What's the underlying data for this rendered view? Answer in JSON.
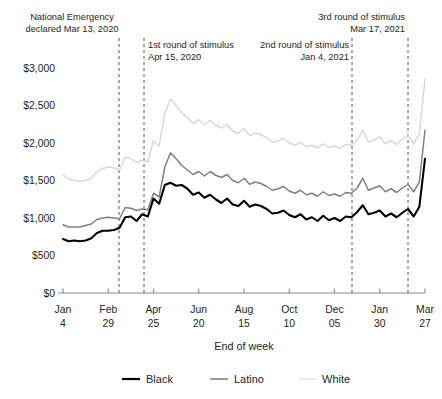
{
  "chart_data": {
    "type": "line",
    "title": "",
    "xlabel": "End of week",
    "ylabel": "",
    "ylim": [
      0,
      3000
    ],
    "ytick_values": [
      0,
      500,
      1000,
      1500,
      2000,
      2500,
      3000
    ],
    "ytick_labels": [
      "$0",
      "$500",
      "$1,000",
      "$1,500",
      "$2,000",
      "$2,500",
      "$3,000"
    ],
    "xtick_labels": [
      {
        "line1": "Jan",
        "line2": "4",
        "index": 0
      },
      {
        "line1": "Feb",
        "line2": "29",
        "index": 8
      },
      {
        "line1": "Apr",
        "line2": "25",
        "index": 16
      },
      {
        "line1": "Jun",
        "line2": "20",
        "index": 24
      },
      {
        "line1": "Aug",
        "line2": "15",
        "index": 32
      },
      {
        "line1": "Oct",
        "line2": "10",
        "index": 40
      },
      {
        "line1": "Dec",
        "line2": "05",
        "index": 48
      },
      {
        "line1": "Jan",
        "line2": "30",
        "index": 56
      },
      {
        "line1": "Mar",
        "line2": "27",
        "index": 64
      }
    ],
    "grid": false,
    "legend_position": "bottom",
    "series": [
      {
        "name": "Black",
        "color": "#000000",
        "width": 2.1,
        "values": [
          720,
          690,
          700,
          690,
          700,
          730,
          800,
          830,
          830,
          840,
          870,
          1010,
          1020,
          960,
          1050,
          1020,
          1260,
          1190,
          1440,
          1470,
          1430,
          1440,
          1390,
          1310,
          1340,
          1270,
          1310,
          1250,
          1200,
          1260,
          1180,
          1160,
          1230,
          1150,
          1180,
          1160,
          1120,
          1060,
          1070,
          1100,
          1040,
          1010,
          1050,
          980,
          1010,
          960,
          1030,
          970,
          1000,
          960,
          1020,
          1010,
          1080,
          1170,
          1050,
          1070,
          1100,
          1020,
          1060,
          1010,
          1070,
          1120,
          1020,
          1150,
          1790
        ]
      },
      {
        "name": "Latino",
        "color": "#808080",
        "width": 1.5,
        "values": [
          910,
          880,
          880,
          880,
          900,
          920,
          980,
          1000,
          1010,
          1000,
          990,
          1140,
          1130,
          1100,
          1120,
          1110,
          1330,
          1280,
          1680,
          1870,
          1790,
          1700,
          1640,
          1580,
          1620,
          1560,
          1620,
          1570,
          1540,
          1580,
          1500,
          1470,
          1530,
          1450,
          1480,
          1460,
          1420,
          1370,
          1390,
          1420,
          1360,
          1330,
          1370,
          1310,
          1330,
          1290,
          1350,
          1300,
          1320,
          1290,
          1340,
          1330,
          1400,
          1530,
          1370,
          1400,
          1430,
          1350,
          1390,
          1340,
          1400,
          1450,
          1350,
          1480,
          2170
        ]
      },
      {
        "name": "White",
        "color": "#d9d9d9",
        "width": 1.5,
        "values": [
          1580,
          1520,
          1500,
          1490,
          1500,
          1530,
          1620,
          1660,
          1680,
          1670,
          1640,
          1810,
          1790,
          1740,
          1770,
          1750,
          2030,
          1960,
          2400,
          2590,
          2500,
          2400,
          2340,
          2260,
          2310,
          2240,
          2300,
          2240,
          2200,
          2250,
          2160,
          2130,
          2190,
          2100,
          2130,
          2110,
          2070,
          2010,
          2030,
          2060,
          2000,
          1970,
          2010,
          1950,
          1970,
          1930,
          1990,
          1940,
          1960,
          1930,
          1980,
          1970,
          2040,
          2170,
          2010,
          2040,
          2080,
          1990,
          2030,
          1980,
          2050,
          2100,
          1990,
          2120,
          2850
        ]
      }
    ],
    "annotations": [
      {
        "id": "national-emergency",
        "lines": [
          "National Emergency",
          "declared Mar 13, 2020"
        ],
        "date_index": 10,
        "align": "middle",
        "text_x": 72,
        "text_y": 20,
        "line_x": 119
      },
      {
        "id": "first-stimulus",
        "lines": [
          "1st round of stimulus",
          "Apr 15, 2020"
        ],
        "date_index": 15,
        "align": "start",
        "text_x": 148,
        "text_y": 48,
        "line_x": 144
      },
      {
        "id": "second-stimulus",
        "lines": [
          "2nd round of stimulus",
          "Jan 4, 2021"
        ],
        "date_index": 53,
        "align": "end",
        "text_x": 349,
        "text_y": 48,
        "line_x": 352
      },
      {
        "id": "third-stimulus",
        "lines": [
          "3rd round of stimulus",
          "Mar 17, 2021"
        ],
        "date_index": 63,
        "align": "end",
        "text_x": 405,
        "text_y": 20,
        "line_x": 408
      }
    ],
    "legend": [
      {
        "label": "Black",
        "color": "#000000",
        "width": 2.2,
        "swatch": true
      },
      {
        "label": "Latino",
        "color": "#808080",
        "width": 1.6,
        "swatch": true
      },
      {
        "label": "White",
        "color": "#e8e8e8",
        "width": 1.6,
        "swatch": true
      }
    ]
  },
  "plot_geometry": {
    "left": 63,
    "right": 425,
    "top": 68,
    "bottom": 293
  }
}
